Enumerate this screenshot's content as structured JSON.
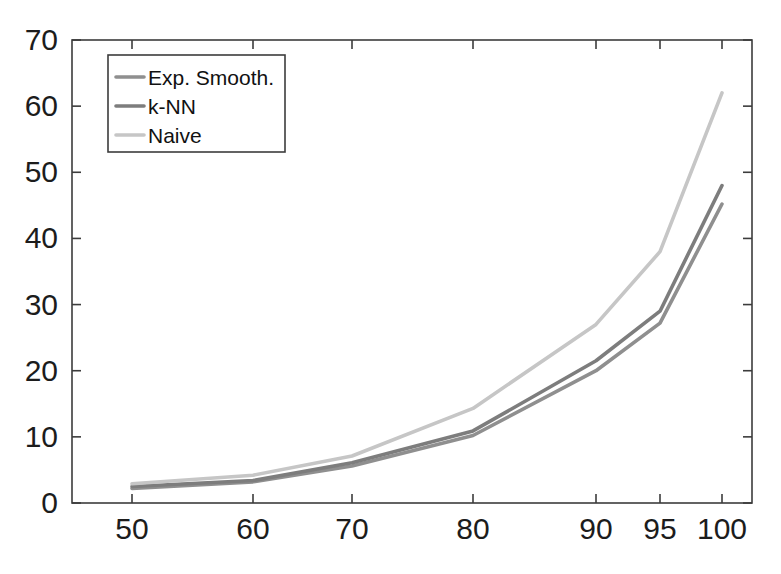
{
  "chart_data": {
    "type": "line",
    "title": "",
    "xlabel": "",
    "ylabel": "",
    "categories": [
      "50",
      "60",
      "70",
      "80",
      "90",
      "95",
      "100"
    ],
    "x_tick_labels": [
      "50",
      "60",
      "70",
      "80",
      "90",
      "95",
      "100"
    ],
    "y_tick_labels": [
      "0",
      "10",
      "20",
      "30",
      "40",
      "50",
      "60",
      "70"
    ],
    "ylim": [
      0,
      70
    ],
    "y_ticks": [
      0,
      10,
      20,
      30,
      40,
      50,
      60,
      70
    ],
    "grid": false,
    "legend_position": "top-left",
    "series": [
      {
        "name": "Exp. Smooth.",
        "color": "#8f8f8f",
        "values": [
          2.2,
          3.2,
          5.6,
          10.2,
          20.0,
          27.2,
          45.2
        ]
      },
      {
        "name": "k-NN",
        "color": "#7d7d7d",
        "values": [
          2.5,
          3.4,
          6.1,
          10.9,
          21.5,
          29.0,
          48.0
        ]
      },
      {
        "name": "Naive",
        "color": "#c6c6c6",
        "values": [
          2.9,
          4.2,
          7.1,
          14.3,
          27.0,
          38.0,
          62.0
        ]
      }
    ]
  },
  "legend": {
    "items": [
      {
        "label": "Exp. Smooth.",
        "color": "#8f8f8f"
      },
      {
        "label": "k-NN",
        "color": "#7d7d7d"
      },
      {
        "label": "Naive",
        "color": "#c6c6c6"
      }
    ]
  },
  "axes": {
    "box_color": "#3c3c3c",
    "tick_color": "#3c3c3c",
    "label_color": "#1c1c1c"
  }
}
